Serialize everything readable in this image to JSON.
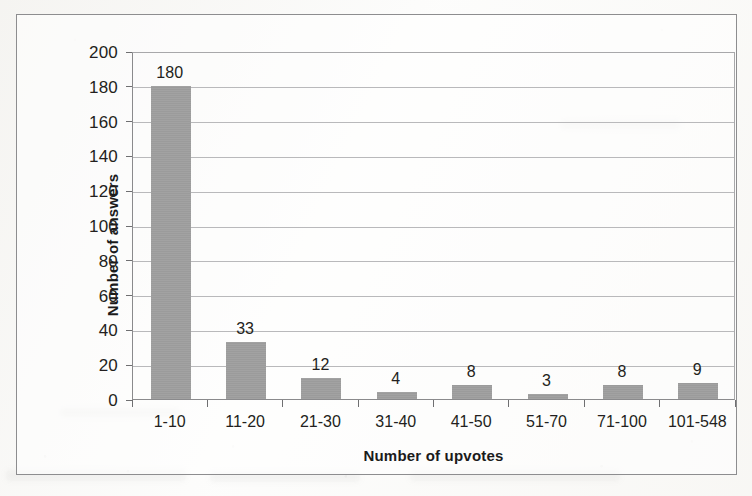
{
  "chart_data": {
    "type": "bar",
    "title": "",
    "xlabel": "Number of upvotes",
    "ylabel": "Number of answers",
    "categories": [
      "1-10",
      "11-20",
      "21-30",
      "31-40",
      "41-50",
      "51-70",
      "71-100",
      "101-548"
    ],
    "values": [
      180,
      33,
      12,
      4,
      8,
      3,
      8,
      9
    ],
    "data_labels": [
      "180",
      "33",
      "12",
      "4",
      "8",
      "3",
      "8",
      "9"
    ],
    "ylim": [
      0,
      200
    ],
    "ytick_labels": [
      "200",
      "180",
      "160",
      "140",
      "120",
      "100",
      "80",
      "60",
      "40",
      "20",
      "0"
    ],
    "ytick_values": [
      200,
      180,
      160,
      140,
      120,
      100,
      80,
      60,
      40,
      20,
      0
    ],
    "grid": "horizontal",
    "legend": "none",
    "series": [
      {
        "name": "Number of answers",
        "values": [
          180,
          33,
          12,
          4,
          8,
          3,
          8,
          9
        ],
        "color": "#9e9e9e"
      }
    ]
  },
  "colors": {
    "bar": "#9e9e9e",
    "gridline": "#b9b9bb",
    "axis": "#8a8a8c",
    "frame": "#8d8d8f",
    "text": "#231f20"
  }
}
